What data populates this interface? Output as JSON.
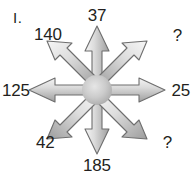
{
  "diagram": {
    "item_marker": "I.",
    "type": "eight-pointed-arrow-star",
    "background_color": "#ffffff",
    "arrow_fill_light": "#f2f2f2",
    "arrow_fill_mid": "#c9c9c9",
    "arrow_fill_dark": "#9a9a9a",
    "arrow_stroke": "#6e6e6e",
    "hub_color": "#c0c0c0",
    "text_color": "#231f20",
    "labels": {
      "top": "37",
      "top_right": "?",
      "right": "25",
      "bottom_right": "?",
      "bottom": "185",
      "bottom_left": "42",
      "left": "125",
      "top_left": "140"
    }
  }
}
